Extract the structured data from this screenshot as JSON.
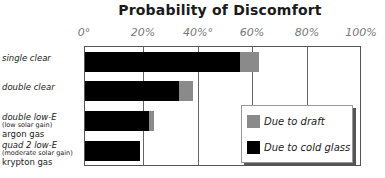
{
  "chart_data": {
    "type": "bar",
    "orientation": "horizontal",
    "stacked": true,
    "title": "Probability of Discomfort",
    "xlabel": "",
    "ylabel": "",
    "xlim": [
      0,
      100
    ],
    "x_ticks": [
      "0°",
      "20%",
      "40%°",
      "60%",
      "80%",
      "100%"
    ],
    "grid": true,
    "legend_position": "lower right inside",
    "categories": [
      {
        "main": "single clear",
        "sub": "",
        "extra": ""
      },
      {
        "main": "double clear",
        "sub": "",
        "extra": ""
      },
      {
        "main": "double low-E",
        "sub": "(low solar gain)",
        "extra": "argon gas"
      },
      {
        "main": "quad 2 low-E",
        "sub": "(moderate solar gain)",
        "extra": "krypton gas"
      }
    ],
    "series": [
      {
        "name": "Due to cold glass",
        "color": "#000000",
        "values": [
          56,
          34,
          23,
          20
        ]
      },
      {
        "name": "Due to draft",
        "color": "#8a8a8a",
        "values": [
          7,
          5,
          2,
          0
        ]
      }
    ],
    "legend": [
      "Due to draft",
      "Due to cold glass"
    ]
  }
}
